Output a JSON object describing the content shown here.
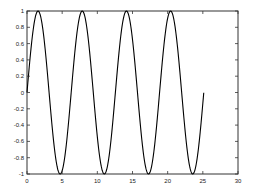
{
  "chart_data": {
    "type": "line",
    "title": "",
    "xlabel": "",
    "ylabel": "",
    "xlim": [
      0,
      30
    ],
    "ylim": [
      -1,
      1
    ],
    "xticks": [
      0,
      5,
      10,
      15,
      20,
      25,
      30
    ],
    "yticks": [
      -1,
      -0.8,
      -0.6,
      -0.4,
      -0.2,
      0,
      0.2,
      0.4,
      0.6,
      0.8,
      1
    ],
    "xtick_labels": [
      "0",
      "5",
      "10",
      "15",
      "20",
      "25",
      "30"
    ],
    "ytick_labels": [
      "-1",
      "-0.8",
      "-0.6",
      "-0.4",
      "-0.2",
      "0",
      "0.2",
      "0.4",
      "0.6",
      "0.8",
      "1"
    ],
    "grid": false,
    "legend": null,
    "series": [
      {
        "name": "sin(t)",
        "function": "sin",
        "x_start": 0,
        "x_end": 25.13,
        "color": "#000000",
        "key_points": [
          {
            "x": 0,
            "y": 0
          },
          {
            "x": 1.57,
            "y": 1
          },
          {
            "x": 4.71,
            "y": -1
          },
          {
            "x": 7.85,
            "y": 1
          },
          {
            "x": 11.0,
            "y": -1
          },
          {
            "x": 14.14,
            "y": 1
          },
          {
            "x": 17.28,
            "y": -1
          },
          {
            "x": 20.42,
            "y": 1
          },
          {
            "x": 23.56,
            "y": -1
          },
          {
            "x": 25.13,
            "y": 0
          }
        ]
      }
    ]
  },
  "layout": {
    "plot_left": 27,
    "plot_top": 11,
    "plot_right": 238,
    "plot_bottom": 174
  }
}
